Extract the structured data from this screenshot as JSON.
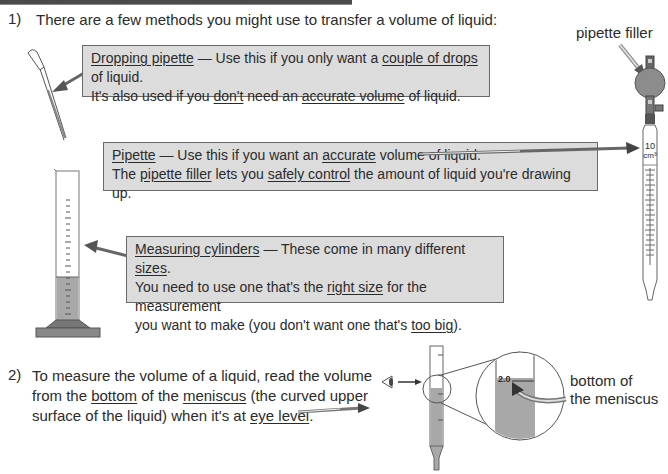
{
  "page": {
    "section1": {
      "number": "1)",
      "intro": "There are a few methods you might use to transfer a volume of liquid:"
    },
    "dropping_pipette_box": {
      "line1": [
        {
          "text": "Dropping pipette",
          "u": true
        },
        {
          "text": " — Use this if you only want a ",
          "u": false
        },
        {
          "text": "couple of drops",
          "u": true
        },
        {
          "text": " of liquid.",
          "u": false
        }
      ],
      "line2": [
        {
          "text": "It's also used if you ",
          "u": false
        },
        {
          "text": "don't",
          "u": true
        },
        {
          "text": " need an ",
          "u": false
        },
        {
          "text": "accurate volume",
          "u": true
        },
        {
          "text": " of liquid.",
          "u": false
        }
      ]
    },
    "pipette_box": {
      "line1": [
        {
          "text": "Pipette",
          "u": true
        },
        {
          "text": " — Use this if you want an ",
          "u": false
        },
        {
          "text": "accurate",
          "u": true
        },
        {
          "text": " volume of liquid.",
          "u": false
        }
      ],
      "line2": [
        {
          "text": "The ",
          "u": false
        },
        {
          "text": "pipette filler",
          "u": true
        },
        {
          "text": " lets you ",
          "u": false
        },
        {
          "text": "safely control",
          "u": true
        },
        {
          "text": " the amount of liquid you're drawing up.",
          "u": false
        }
      ]
    },
    "measuring_cylinder_box": {
      "line1": [
        {
          "text": "Measuring cylinders",
          "u": true
        },
        {
          "text": " — These come in many different ",
          "u": false
        },
        {
          "text": "sizes",
          "u": true
        },
        {
          "text": ".",
          "u": false
        }
      ],
      "line2": [
        {
          "text": "You need to use one that's the ",
          "u": false
        },
        {
          "text": "right size",
          "u": true
        },
        {
          "text": " for the measurement",
          "u": false
        }
      ],
      "line3": [
        {
          "text": "you want to make (you don't want one that's ",
          "u": false
        },
        {
          "text": "too big",
          "u": true
        },
        {
          "text": ").",
          "u": false
        }
      ]
    },
    "pipette_filler_label": "pipette filler",
    "pipette_volume_label": "10",
    "pipette_unit_label": "cm³",
    "section2": {
      "number": "2)",
      "line1": [
        {
          "text": "To measure the volume of a liquid, read the volume",
          "u": false
        }
      ],
      "line2": [
        {
          "text": "from the ",
          "u": false
        },
        {
          "text": "bottom",
          "u": true
        },
        {
          "text": " of the ",
          "u": false
        },
        {
          "text": "meniscus",
          "u": true
        },
        {
          "text": " (the curved upper",
          "u": false
        }
      ],
      "line3": [
        {
          "text": "surface of the liquid) when it's at ",
          "u": false
        },
        {
          "text": "eye level",
          "u": true
        },
        {
          "text": ".",
          "u": false
        }
      ]
    },
    "meniscus_reading": "2.0",
    "meniscus_label_line1": "bottom of",
    "meniscus_label_line2": "the meniscus"
  },
  "colors": {
    "box_fill": "#dcdcdc",
    "liquid": "#a8a8a8",
    "bulb": "#8c8c8c",
    "arrow": "#5a5a5a"
  }
}
